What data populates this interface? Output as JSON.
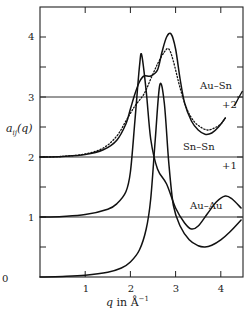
{
  "chart_data": {
    "type": "line",
    "title": "",
    "xlabel": "q in Å⁻¹",
    "ylabel": "a_ij(q)",
    "xlim": [
      0,
      4.5
    ],
    "ylim": [
      0,
      4.5
    ],
    "x_ticks": [
      "0",
      "1",
      "2",
      "3",
      "4"
    ],
    "y_ticks": [
      "0",
      "1",
      "2",
      "3",
      "4"
    ],
    "grid": false,
    "legend_position": "inline labels",
    "series": [
      {
        "name": "Au-Au",
        "offset": 0,
        "offset_label": "",
        "style": "solid",
        "x": [
          0.0,
          0.5,
          1.0,
          1.5,
          1.8,
          2.0,
          2.2,
          2.35,
          2.45,
          2.55,
          2.65,
          2.75,
          2.85,
          2.95,
          3.1,
          3.3,
          3.5,
          3.65,
          3.8,
          4.0,
          4.2,
          4.45
        ],
        "y": [
          0.0,
          0.01,
          0.03,
          0.08,
          0.15,
          0.25,
          0.45,
          0.8,
          1.3,
          2.3,
          3.2,
          2.9,
          1.9,
          1.2,
          0.85,
          0.62,
          0.52,
          0.5,
          0.53,
          0.62,
          0.75,
          0.95
        ]
      },
      {
        "name": "Sn-Sn",
        "offset": 1,
        "offset_label": "+1",
        "style": "solid",
        "x": [
          0.0,
          0.5,
          1.0,
          1.5,
          1.7,
          1.9,
          2.0,
          2.1,
          2.2,
          2.25,
          2.35,
          2.45,
          2.6,
          2.8,
          3.0,
          3.2,
          3.35,
          3.5,
          3.7,
          3.9,
          4.1,
          4.25,
          4.45
        ],
        "y": [
          0.0,
          0.01,
          0.04,
          0.13,
          0.22,
          0.42,
          0.75,
          1.6,
          2.5,
          2.7,
          2.1,
          1.3,
          0.8,
          0.55,
          0.15,
          -0.1,
          -0.2,
          -0.15,
          0.05,
          0.25,
          0.35,
          0.3,
          0.15
        ]
      },
      {
        "name": "Au-Sn",
        "offset": 2,
        "offset_label": "+2",
        "style": "solid",
        "x": [
          0.0,
          0.5,
          1.0,
          1.4,
          1.7,
          1.9,
          2.0,
          2.1,
          2.2,
          2.3,
          2.45,
          2.6,
          2.7,
          2.8,
          2.9,
          3.0,
          3.1,
          3.2,
          3.35,
          3.5,
          3.65,
          3.8,
          3.95,
          4.1
        ],
        "y": [
          0.0,
          0.01,
          0.04,
          0.12,
          0.28,
          0.55,
          0.8,
          1.05,
          1.25,
          1.35,
          1.35,
          1.45,
          1.75,
          2.0,
          2.05,
          1.8,
          1.3,
          0.9,
          0.6,
          0.45,
          0.38,
          0.4,
          0.5,
          0.65
        ]
      },
      {
        "name": "Au-Sn (dotted)",
        "offset": 2,
        "offset_label": "+2",
        "style": "dotted",
        "x": [
          0.0,
          0.5,
          1.0,
          1.4,
          1.7,
          1.9,
          2.1,
          2.3,
          2.45,
          2.6,
          2.75,
          2.85,
          2.95,
          3.1,
          3.25,
          3.4,
          3.55,
          3.7,
          3.85,
          4.0,
          4.1
        ],
        "y": [
          0.0,
          0.01,
          0.05,
          0.15,
          0.35,
          0.6,
          0.85,
          1.05,
          1.3,
          1.55,
          1.75,
          1.8,
          1.6,
          1.15,
          0.8,
          0.6,
          0.5,
          0.45,
          0.48,
          0.55,
          0.65
        ]
      }
    ],
    "annotations": [
      "Au-Sn",
      "+2",
      "Sn-Sn",
      "+1",
      "Au-Au"
    ]
  },
  "labels": {
    "y_axis": "a",
    "y_axis_sub": "ij",
    "y_axis_arg": "(q)",
    "x_axis_q": "q",
    "x_axis_rest": " in Å",
    "x_axis_sup": "−1",
    "au_sn": "Au–Sn",
    "au_sn_offset": "+2",
    "sn_sn": "Sn–Sn",
    "sn_sn_offset": "+1",
    "au_au": "Au–Au",
    "xticks": [
      "0",
      "1",
      "2",
      "3",
      "4"
    ],
    "yticks": [
      "1",
      "2",
      "3",
      "4"
    ]
  }
}
